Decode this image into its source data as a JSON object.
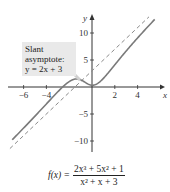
{
  "chart_data": {
    "type": "line",
    "title": "",
    "xlabel": "x",
    "ylabel": "y",
    "xlim": [
      -7.5,
      6.2
    ],
    "ylim": [
      -11.5,
      13
    ],
    "x_ticks": [
      -6,
      -4,
      2,
      4
    ],
    "x_tick_labels": [
      "−6",
      "−4",
      "2",
      "4"
    ],
    "y_ticks": [
      10,
      5,
      -5,
      -10
    ],
    "y_tick_labels": [
      "10",
      "5",
      "−5",
      "−10"
    ],
    "grid": false,
    "series": [
      {
        "name": "f(x) = (2x^3 + 5x^2 + 1)/(x^2 + x + 3)",
        "style": "solid",
        "color": "#7a7a7a",
        "x": [
          -7,
          -6,
          -5,
          -4,
          -3,
          -2,
          -1,
          0,
          1,
          2,
          3,
          4,
          5.5
        ],
        "y": [
          -11.13,
          -9.09,
          -7.0,
          -4.87,
          -2.44,
          0.6,
          1.33,
          0.33,
          1.6,
          4.33,
          6.67,
          8.6,
          11.5
        ]
      },
      {
        "name": "Slant asymptote y = 2x + 3",
        "style": "dashed",
        "color": "#7a7a7a",
        "x": [
          -7.2,
          5.0
        ],
        "y": [
          -11.4,
          13.0
        ]
      }
    ],
    "annotations": [
      {
        "text": "Slant asymptote: y = 2x + 3",
        "target": "dashed line"
      }
    ]
  },
  "annotation": {
    "line1": "Slant",
    "line2": "asymptote:",
    "line3": "y = 2x + 3"
  },
  "formula": {
    "lhs": "f(x) =",
    "numerator": "2x³ + 5x² + 1",
    "denominator": "x² + x + 3"
  }
}
